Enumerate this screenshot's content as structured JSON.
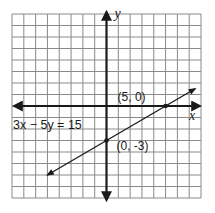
{
  "chart_data": {
    "type": "line",
    "title": "",
    "xlabel": "x",
    "ylabel": "y",
    "xlim": [
      -8,
      8
    ],
    "ylim": [
      -8,
      8
    ],
    "grid": true,
    "equation_label": "3x − 5y = 15",
    "line": {
      "x1": -5,
      "y1": -6,
      "x2": 7.5,
      "y2": 1.5
    },
    "points": [
      {
        "x": 5,
        "y": 0,
        "label": "(5, 0)"
      },
      {
        "x": 0,
        "y": -3,
        "label": "(0, -3)"
      }
    ]
  }
}
